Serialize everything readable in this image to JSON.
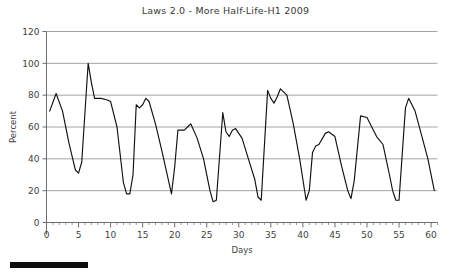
{
  "figure": {
    "title": "Laws 2.0 - More Half-Life-H1 2009",
    "background_color": "#ffffff",
    "line_color": "#111111",
    "grid_color": "#9a9a9a",
    "axis_color": "#6e6e6e",
    "text_color": "#3f3f3f"
  },
  "bottom_bar": {
    "name": "scrollbar-thumb",
    "color": "#0d0d0d"
  },
  "chart_data": {
    "type": "line",
    "title": "Laws 2.0 - More Half-Life-H1 2009",
    "xlabel": "Days",
    "ylabel": "Percent",
    "xlim": [
      0,
      61
    ],
    "ylim": [
      0,
      120
    ],
    "grid": "horizontal",
    "legend": "none",
    "x_ticks": [
      0,
      5,
      10,
      15,
      20,
      25,
      30,
      35,
      40,
      45,
      50,
      55,
      60
    ],
    "x_tick_labels": [
      "0",
      "5",
      "10",
      "15",
      "20",
      "25",
      "30",
      "35",
      "40",
      "45",
      "50",
      "55",
      "60"
    ],
    "x_minor_tick_step": 1,
    "y_ticks": [
      0,
      20,
      40,
      60,
      80,
      100,
      120
    ],
    "y_tick_labels": [
      "0",
      "20",
      "40",
      "60",
      "80",
      "100",
      "120"
    ],
    "series": [
      {
        "name": "Percent",
        "color": "#111111",
        "x": [
          0.5,
          1.5,
          2.5,
          3.5,
          4.5,
          5.0,
          5.5,
          6.5,
          7.0,
          7.5,
          8.5,
          9.5,
          10.0,
          11.0,
          12.0,
          12.5,
          13.0,
          13.5,
          14.0,
          14.5,
          15.0,
          15.5,
          16.0,
          17.0,
          18.0,
          19.0,
          19.5,
          20.0,
          20.5,
          21.5,
          22.0,
          22.5,
          23.5,
          24.5,
          25.5,
          26.0,
          26.5,
          27.5,
          28.0,
          28.5,
          29.0,
          29.5,
          30.5,
          31.5,
          32.5,
          33.0,
          33.5,
          34.5,
          35.0,
          35.5,
          36.0,
          36.5,
          37.5,
          38.5,
          39.5,
          40.5,
          41.0,
          41.5,
          42.0,
          42.5,
          43.5,
          44.0,
          45.0,
          46.0,
          47.0,
          47.5,
          48.0,
          49.0,
          50.0,
          51.0,
          51.5,
          52.5,
          53.5,
          54.0,
          54.5,
          55.0,
          56.0,
          56.5,
          57.5,
          58.5,
          59.5,
          60.5
        ],
        "y": [
          70,
          81,
          70,
          50,
          33,
          31,
          38,
          100,
          88,
          78,
          78,
          77,
          76,
          60,
          25,
          18,
          18,
          30,
          74,
          72,
          74,
          78,
          76,
          62,
          45,
          27,
          18,
          35,
          58,
          58,
          60,
          62,
          53,
          40,
          20,
          13,
          14,
          69,
          57,
          54,
          58,
          59,
          53,
          40,
          27,
          16,
          14,
          83,
          78,
          75,
          79,
          84,
          80,
          62,
          40,
          14,
          20,
          44,
          48,
          49,
          56,
          57,
          54,
          36,
          20,
          15,
          26,
          67,
          66,
          58,
          54,
          49,
          30,
          20,
          14,
          14,
          72,
          78,
          70,
          55,
          40,
          20
        ]
      }
    ]
  }
}
